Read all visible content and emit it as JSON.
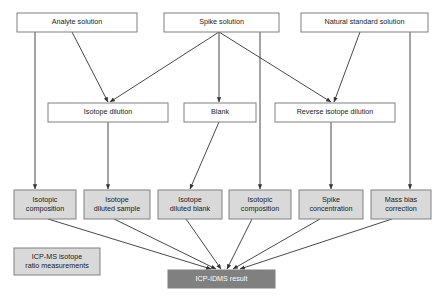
{
  "diagram": {
    "colors": {
      "box_white_fill": "#ffffff",
      "box_gray_fill": "#d9d9d9",
      "box_dark_fill": "#808080",
      "box_stroke": "#808080",
      "edge_stroke": "#333333",
      "text": "#1a1a1a",
      "text_on_dark": "#ffffff"
    },
    "nodes": [
      {
        "id": "analyte-solution",
        "label": "Analyte solution",
        "lines": [
          "Analyte solution"
        ],
        "style": "white",
        "x": 17,
        "y": 13,
        "w": 120,
        "h": 19
      },
      {
        "id": "spike-solution",
        "label": "Spike solution",
        "lines": [
          "Spike solution"
        ],
        "style": "white",
        "x": 164,
        "y": 13,
        "w": 115,
        "h": 19
      },
      {
        "id": "natural-standard-solution",
        "label": "Natural standard solution",
        "lines": [
          "Natural standard solution"
        ],
        "style": "white",
        "x": 301,
        "y": 13,
        "w": 127,
        "h": 19
      },
      {
        "id": "isotope-dilution",
        "label": "Isotope dilution",
        "lines": [
          "Isotope dilution"
        ],
        "style": "white",
        "x": 48,
        "y": 103,
        "w": 120,
        "h": 19
      },
      {
        "id": "blank",
        "label": "Blank",
        "lines": [
          "Blank"
        ],
        "style": "white",
        "x": 184,
        "y": 103,
        "w": 72,
        "h": 19
      },
      {
        "id": "reverse-isotope-dilution",
        "label": "Reverse isotope dilution",
        "lines": [
          "Reverse isotope dilution"
        ],
        "style": "white",
        "x": 275,
        "y": 103,
        "w": 120,
        "h": 19
      },
      {
        "id": "isotopic-composition-analyte",
        "label": "Isotopic composition",
        "lines": [
          "Isotopic",
          "composition"
        ],
        "style": "gray",
        "x": 14,
        "y": 190,
        "w": 62,
        "h": 29
      },
      {
        "id": "isotope-diluted-sample",
        "label": "Isotope diluted sample",
        "lines": [
          "Isotope",
          "diluted sample"
        ],
        "style": "gray",
        "x": 84,
        "y": 190,
        "w": 66,
        "h": 29
      },
      {
        "id": "isotope-diluted-blank",
        "label": "Isotope diluted blank",
        "lines": [
          "Isotope",
          "diluted blank"
        ],
        "style": "gray",
        "x": 158,
        "y": 190,
        "w": 64,
        "h": 29
      },
      {
        "id": "isotopic-composition-spike",
        "label": "Isotopic composition",
        "lines": [
          "Isotopic",
          "composition"
        ],
        "style": "gray",
        "x": 229,
        "y": 190,
        "w": 62,
        "h": 29
      },
      {
        "id": "spike-concentration",
        "label": "Spike concentration",
        "lines": [
          "Spike",
          "concentration"
        ],
        "style": "gray",
        "x": 299,
        "y": 190,
        "w": 64,
        "h": 29
      },
      {
        "id": "mass-bias-correction",
        "label": "Mass bias correction",
        "lines": [
          "Mass bias",
          "correction"
        ],
        "style": "gray",
        "x": 371,
        "y": 190,
        "w": 60,
        "h": 29
      },
      {
        "id": "icp-ms-isotope-ratio-measurements",
        "label": "ICP-MS isotope ratio measurements",
        "lines": [
          "ICP-MS isotope",
          "ratio measurements"
        ],
        "style": "gray",
        "x": 14,
        "y": 248,
        "w": 86,
        "h": 27
      },
      {
        "id": "icp-idms-result",
        "label": "ICP-IDMS result",
        "lines": [
          "ICP-IDMS result"
        ],
        "style": "dark",
        "x": 168,
        "y": 270,
        "w": 107,
        "h": 18
      }
    ],
    "edges": [
      {
        "id": "analyte-to-isotopic-composition",
        "from": "analyte-solution",
        "to": "isotopic-composition-analyte",
        "points": "35,32 35,189",
        "arrow": true
      },
      {
        "id": "analyte-to-isotope-dilution",
        "from": "analyte-solution",
        "to": "isotope-dilution",
        "points": "72,32 108,102",
        "arrow": true
      },
      {
        "id": "spike-to-isotope-dilution",
        "from": "spike-solution",
        "to": "isotope-dilution",
        "points": "219,32 110,102",
        "arrow": true
      },
      {
        "id": "spike-to-blank",
        "from": "spike-solution",
        "to": "blank",
        "points": "219,32 219,102",
        "arrow": true
      },
      {
        "id": "spike-to-reverse-isotope-dilution",
        "from": "spike-solution",
        "to": "reverse-isotope-dilution",
        "points": "219,32 331,102",
        "arrow": true
      },
      {
        "id": "spike-to-isotopic-composition",
        "from": "spike-solution",
        "to": "isotopic-composition-spike",
        "points": "260,32 260,189",
        "arrow": true
      },
      {
        "id": "natural-standard-to-reverse-isotope-dilution",
        "from": "natural-standard-solution",
        "to": "reverse-isotope-dilution",
        "points": "360,32 334,102",
        "arrow": true
      },
      {
        "id": "natural-standard-to-mass-bias",
        "from": "natural-standard-solution",
        "to": "mass-bias-correction",
        "points": "410,32 410,189",
        "arrow": true
      },
      {
        "id": "isotope-dilution-to-diluted-sample",
        "from": "isotope-dilution",
        "to": "isotope-diluted-sample",
        "points": "108,122 108,189",
        "arrow": true
      },
      {
        "id": "blank-to-diluted-blank",
        "from": "blank",
        "to": "isotope-diluted-blank",
        "points": "219,122 190,189",
        "arrow": true
      },
      {
        "id": "reverse-isotope-dilution-to-spike-concentration",
        "from": "reverse-isotope-dilution",
        "to": "spike-concentration",
        "points": "331,122 331,189",
        "arrow": true
      },
      {
        "id": "isotopic-composition-analyte-to-result",
        "from": "isotopic-composition-analyte",
        "to": "icp-idms-result",
        "points": "48,219 211,269",
        "arrow": true
      },
      {
        "id": "isotope-diluted-sample-to-result",
        "from": "isotope-diluted-sample",
        "to": "icp-idms-result",
        "points": "114,219 216,269",
        "arrow": true
      },
      {
        "id": "isotope-diluted-blank-to-result",
        "from": "isotope-diluted-blank",
        "to": "icp-idms-result",
        "points": "186,219 221,269",
        "arrow": true
      },
      {
        "id": "isotopic-composition-spike-to-result",
        "from": "isotopic-composition-spike",
        "to": "icp-idms-result",
        "points": "252,219 227,269",
        "arrow": true
      },
      {
        "id": "spike-concentration-to-result",
        "from": "spike-concentration",
        "to": "icp-idms-result",
        "points": "320,219 233,269",
        "arrow": true
      },
      {
        "id": "mass-bias-correction-to-result",
        "from": "mass-bias-correction",
        "to": "icp-idms-result",
        "points": "392,219 240,269",
        "arrow": true
      }
    ]
  }
}
